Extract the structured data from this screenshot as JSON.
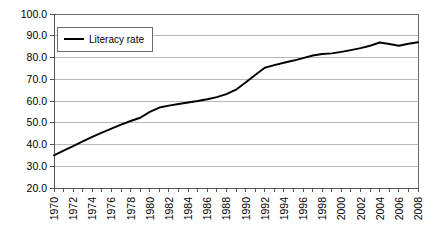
{
  "chart_data": {
    "type": "line",
    "title": "",
    "xlabel": "",
    "ylabel": "",
    "ylim": [
      20.0,
      100.0
    ],
    "xlim": [
      1970,
      2008
    ],
    "grid": true,
    "legend_position": "top-left-inside",
    "ytick_labels": [
      "100.0",
      "90.0",
      "80.0",
      "70.0",
      "60.0",
      "50.0",
      "40.0",
      "30.0",
      "20.0"
    ],
    "ytick_values": [
      100.0,
      90.0,
      80.0,
      70.0,
      60.0,
      50.0,
      40.0,
      30.0,
      20.0
    ],
    "xtick_labels": [
      "1970",
      "1972",
      "1974",
      "1976",
      "1978",
      "1980",
      "1982",
      "1984",
      "1986",
      "1988",
      "1990",
      "1992",
      "1994",
      "1996",
      "1998",
      "2000",
      "2002",
      "2004",
      "2006",
      "2008"
    ],
    "xtick_values": [
      1970,
      1972,
      1974,
      1976,
      1978,
      1980,
      1982,
      1984,
      1986,
      1988,
      1990,
      1992,
      1994,
      1996,
      1998,
      2000,
      2002,
      2004,
      2006,
      2008
    ],
    "x": [
      1970,
      1971,
      1972,
      1973,
      1974,
      1975,
      1976,
      1977,
      1978,
      1979,
      1980,
      1981,
      1982,
      1983,
      1984,
      1985,
      1986,
      1987,
      1988,
      1989,
      1990,
      1991,
      1992,
      1993,
      1994,
      1995,
      1996,
      1997,
      1998,
      1999,
      2000,
      2001,
      2002,
      2003,
      2004,
      2005,
      2006,
      2007,
      2008
    ],
    "series": [
      {
        "name": "Literacy rate",
        "color": "#000000",
        "values": [
          35.0,
          37.2,
          39.3,
          41.4,
          43.5,
          45.5,
          47.3,
          49.1,
          50.8,
          52.3,
          55.0,
          57.0,
          57.9,
          58.6,
          59.3,
          60.0,
          60.8,
          61.8,
          63.2,
          65.2,
          68.5,
          72.0,
          75.3,
          76.5,
          77.6,
          78.6,
          79.7,
          80.9,
          81.6,
          81.9,
          82.6,
          83.4,
          84.3,
          85.4,
          86.9,
          86.2,
          85.4,
          86.3,
          87.0
        ]
      }
    ]
  },
  "legend": {
    "entries": [
      {
        "label": "Literacy rate"
      }
    ]
  }
}
